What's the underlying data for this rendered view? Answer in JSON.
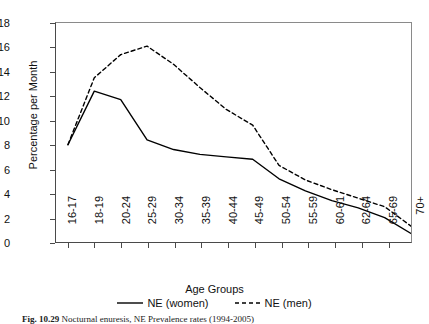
{
  "chart_data": {
    "type": "line",
    "title": "",
    "xlabel": "Age Groups",
    "ylabel": "Percentage per Month",
    "ylim": [
      0,
      18
    ],
    "ytick_step": 2,
    "yticks": [
      18,
      16,
      14,
      12,
      10,
      8,
      6,
      4,
      2,
      0
    ],
    "grid": false,
    "legend_position": "bottom-center",
    "categories": [
      "16-17",
      "18-19",
      "20-24",
      "25-29",
      "30-34",
      "35-39",
      "40-44",
      "45-49",
      "50-54",
      "55-59",
      "60-61",
      "62-64",
      "65-69",
      "70+"
    ],
    "series": [
      {
        "name": "NE (women)",
        "style": "solid",
        "color": "#000000",
        "values": [
          8.0,
          12.4,
          11.7,
          8.4,
          7.6,
          7.2,
          7.0,
          6.8,
          5.2,
          4.2,
          3.4,
          2.8,
          2.0,
          0.7
        ]
      },
      {
        "name": "NE (men)",
        "style": "dashed",
        "color": "#000000",
        "values": [
          8.0,
          13.5,
          15.4,
          16.1,
          14.6,
          12.7,
          10.9,
          9.6,
          6.3,
          5.1,
          4.3,
          3.6,
          2.9,
          1.3
        ]
      }
    ]
  },
  "legend": {
    "items": [
      {
        "label": "NE (women)",
        "style": "solid"
      },
      {
        "label": "NE (men)",
        "style": "dashed"
      }
    ]
  },
  "caption": {
    "label": "Fig. 10.29",
    "text": "Nocturnal enuresis, NE Prevalence rates (1994-2005)"
  },
  "colors": {
    "line": "#000000",
    "axis": "#4a4a4a",
    "frame": "#8a8a8a",
    "background": "#ffffff",
    "text": "#111111"
  }
}
